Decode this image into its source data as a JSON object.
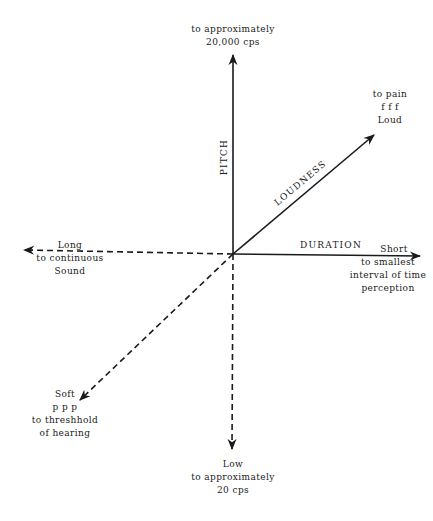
{
  "diagram": {
    "title": "",
    "origin": {
      "x": 233,
      "y": 254
    },
    "axes": [
      {
        "id": "pitch-up",
        "axis_label": "PITCH",
        "style": "solid",
        "direction": "up",
        "end_label": [
          "to approximately",
          "20,000 cps"
        ]
      },
      {
        "id": "pitch-down",
        "style": "dashed",
        "direction": "down",
        "end_label": [
          "Low",
          "to approximately",
          "20 cps"
        ]
      },
      {
        "id": "duration-right",
        "axis_label": "DURATION",
        "style": "solid",
        "direction": "right",
        "end_label": [
          "Short",
          "to smallest",
          "interval of time",
          "perception"
        ]
      },
      {
        "id": "duration-left",
        "style": "dashed",
        "direction": "left",
        "end_label": [
          "Long",
          "to continuous",
          "Sound"
        ]
      },
      {
        "id": "loudness-up-right",
        "axis_label": "LOUDNESS",
        "style": "solid",
        "direction": "up-right",
        "end_label": [
          "to pain",
          "f f f",
          "Loud"
        ]
      },
      {
        "id": "loudness-down-left",
        "style": "dashed",
        "direction": "down-left",
        "end_label": [
          "Soft",
          "p p p",
          "to threshhold",
          "of hearing"
        ]
      }
    ]
  },
  "colors": {
    "ink": "#1a1a1a",
    "background": "#ffffff"
  }
}
